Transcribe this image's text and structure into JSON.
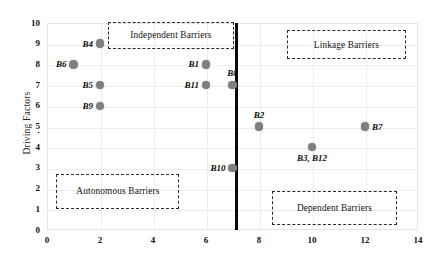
{
  "chart_data": {
    "type": "scatter",
    "title": "",
    "xlabel": "",
    "ylabel": "Driving Factors",
    "xlim": [
      0,
      14
    ],
    "ylim": [
      0,
      10
    ],
    "xticks": [
      0,
      2,
      4,
      6,
      8,
      10,
      12,
      14
    ],
    "yticks": [
      0,
      1,
      2,
      3,
      4,
      5,
      6,
      7,
      8,
      9,
      10
    ],
    "grid": true,
    "legend": "none",
    "points": [
      {
        "label": "B4",
        "x": 2,
        "y": 9,
        "label_pos": "left"
      },
      {
        "label": "B6",
        "x": 1,
        "y": 8,
        "label_pos": "left"
      },
      {
        "label": "B1",
        "x": 6,
        "y": 8,
        "label_pos": "left"
      },
      {
        "label": "B5",
        "x": 2,
        "y": 7,
        "label_pos": "left"
      },
      {
        "label": "B11",
        "x": 6,
        "y": 7,
        "label_pos": "left"
      },
      {
        "label": "B8",
        "x": 7,
        "y": 7,
        "label_pos": "top"
      },
      {
        "label": "B9",
        "x": 2,
        "y": 6,
        "label_pos": "left"
      },
      {
        "label": "B2",
        "x": 8,
        "y": 5,
        "label_pos": "top"
      },
      {
        "label": "B7",
        "x": 12,
        "y": 5,
        "label_pos": "right"
      },
      {
        "label": "B3, B12",
        "x": 10,
        "y": 4,
        "label_pos": "bottom"
      },
      {
        "label": "B10",
        "x": 7,
        "y": 3,
        "label_pos": "left"
      }
    ],
    "divider": {
      "orientation": "vertical",
      "x": 7.15,
      "color": "#0a0a0a"
    },
    "annotations": [
      {
        "name": "independent-barriers",
        "text": "Independent Barriers",
        "x0": 2.3,
        "y0": 10.05,
        "x1": 7.05,
        "y1": 8.75
      },
      {
        "name": "linkage-barriers",
        "text": "Linkage Barriers",
        "x0": 9.05,
        "y0": 9.65,
        "x1": 13.55,
        "y1": 8.25
      },
      {
        "name": "autonomous-barriers",
        "text": "Autonomous Barriers",
        "x0": 0.35,
        "y0": 2.72,
        "x1": 5.0,
        "y1": 1.0
      },
      {
        "name": "dependent-barriers",
        "text": "Dependent Barriers",
        "x0": 8.5,
        "y0": 1.9,
        "x1": 13.2,
        "y1": 0.22
      }
    ],
    "colors": {
      "point": "#7f7f7f",
      "grid": "#ededed",
      "frame": "#e6e6e6",
      "divider": "#0a0a0a",
      "box_border": "#2b2b2b",
      "text": "#111111"
    },
    "stray_mark": {
      "text": "·",
      "x": -0.28,
      "y": 4.7
    }
  }
}
